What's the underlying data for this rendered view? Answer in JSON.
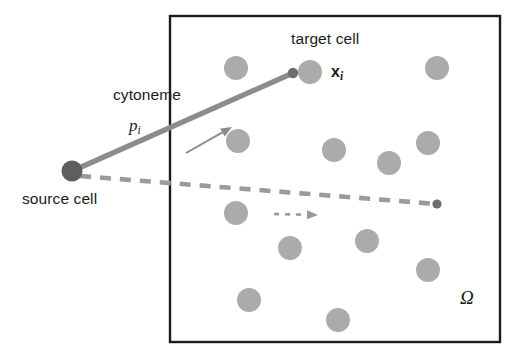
{
  "figure": {
    "width": 525,
    "height": 363,
    "background": "#ffffff"
  },
  "labels": {
    "target_cell": "target cell",
    "cytoneme": "cytoneme",
    "p_i": "p",
    "p_i_sub": "i",
    "x_i": "x",
    "x_i_sub": "i",
    "source_cell": "source cell",
    "omega": "Ω"
  },
  "colors": {
    "domain_border": "#1b1b1b",
    "cell_fill": "#ababab",
    "source_cell_fill": "#5e5e5e",
    "cytoneme_stroke": "#8c8c8c",
    "cytoneme_tip": "#6e6e6e",
    "dashed_stroke": "#9a9a9a",
    "dashed_tip": "#6e6e6e",
    "arrow_stroke": "#8c8c8c",
    "text": "#1b1b1b"
  },
  "domain_box": {
    "name": "omega-domain",
    "x": 170,
    "y": 16,
    "width": 330,
    "height": 326,
    "stroke_width": 2.4
  },
  "source_cell": {
    "name": "source-cell-marker",
    "cx": 72,
    "cy": 171,
    "r": 10.5
  },
  "cytoneme": {
    "name": "cytoneme-segment",
    "x1": 79,
    "y1": 168,
    "x2": 293,
    "y2": 73,
    "stroke_width": 5.2,
    "tip_r": 5.2
  },
  "cytoneme_direction_arrow": {
    "name": "cytoneme-direction-arrow",
    "x1": 186,
    "y1": 153,
    "x2": 232,
    "y2": 127,
    "stroke_width": 2.0,
    "head_size": 11
  },
  "dashed_path": {
    "name": "dashed-trajectory",
    "x1": 80,
    "y1": 176,
    "x2": 437,
    "y2": 204,
    "stroke_width": 4.6,
    "dash": "11 9",
    "tip_r": 4.6
  },
  "dashed_direction_arrow": {
    "name": "dashed-direction-arrow",
    "x1": 274,
    "y1": 214,
    "x2": 318,
    "y2": 215,
    "stroke_width": 2.6,
    "dash": "5 6",
    "head_size": 11
  },
  "target_cell": {
    "name": "target-cell-circle",
    "cx": 310,
    "cy": 72,
    "r": 12
  },
  "cells": [
    {
      "cx": 236,
      "cy": 68,
      "r": 12
    },
    {
      "cx": 310,
      "cy": 72,
      "r": 12
    },
    {
      "cx": 437,
      "cy": 68,
      "r": 12
    },
    {
      "cx": 238,
      "cy": 141,
      "r": 12
    },
    {
      "cx": 334,
      "cy": 150,
      "r": 12
    },
    {
      "cx": 389,
      "cy": 163,
      "r": 12
    },
    {
      "cx": 428,
      "cy": 143,
      "r": 12
    },
    {
      "cx": 236,
      "cy": 213,
      "r": 12
    },
    {
      "cx": 290,
      "cy": 248,
      "r": 12
    },
    {
      "cx": 367,
      "cy": 241,
      "r": 12
    },
    {
      "cx": 428,
      "cy": 270,
      "r": 12
    },
    {
      "cx": 249,
      "cy": 300,
      "r": 12
    },
    {
      "cx": 338,
      "cy": 320,
      "r": 12
    }
  ]
}
